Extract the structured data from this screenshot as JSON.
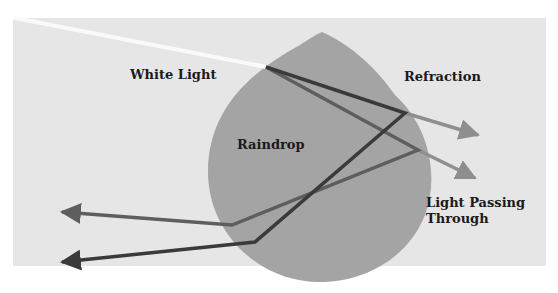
{
  "diagram": {
    "colors": {
      "background": "#ffffff",
      "panel": "#e6e6e6",
      "raindrop": "#a4a4a4",
      "white_light": "#fafafa",
      "dark_ray": "#3a3a3a",
      "mid_ray": "#5e5e5e",
      "exit_ray": "#8e8e8e"
    },
    "labels": {
      "white_light": "White Light",
      "refraction": "Refraction",
      "raindrop": "Raindrop",
      "light_passing_line1": "Light Passing",
      "light_passing_line2": "Through"
    },
    "nodes": [
      {
        "id": "white-light",
        "label": "White Light"
      },
      {
        "id": "raindrop",
        "label": "Raindrop"
      },
      {
        "id": "refraction",
        "label": "Refraction"
      },
      {
        "id": "light-passing-through",
        "label": "Light Passing Through"
      }
    ],
    "edges": [
      {
        "from": "white-light",
        "to": "raindrop",
        "type": "incoming ray"
      },
      {
        "from": "raindrop",
        "to": "refraction",
        "type": "refracted exit ray"
      },
      {
        "from": "raindrop",
        "to": "light-passing-through",
        "type": "exit ray"
      },
      {
        "from": "raindrop",
        "to": "left",
        "type": "reflected ray (dark)"
      },
      {
        "from": "raindrop",
        "to": "left",
        "type": "reflected ray (mid)"
      }
    ]
  }
}
